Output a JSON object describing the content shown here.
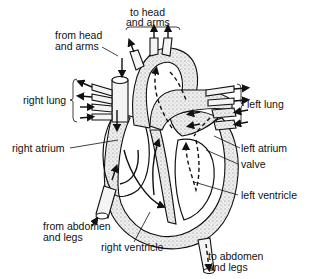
{
  "diagram": {
    "labels": {
      "to_head_and_arms": [
        "to head",
        "and arms"
      ],
      "from_head_and_arms": [
        "from head",
        "and arms"
      ],
      "right_lung": "right lung",
      "left_lung": "left lung",
      "right_atrium": "right atrium",
      "left_atrium": "left atrium",
      "valve": "valve",
      "left_ventricle": "left ventricle",
      "right_ventricle": "right ventricle",
      "from_abdomen_and_legs": [
        "from abdomen",
        "and legs"
      ],
      "to_abdomen_and_legs": [
        "to abdomen",
        "and legs"
      ]
    },
    "legend": {
      "solid_arrow": "deoxygenated blood flow (right side)",
      "dashed_arrow": "oxygenated blood flow (left side)"
    },
    "colors": {
      "ink": "#111111",
      "background": "#ffffff",
      "stipple": "#cfcfcf"
    }
  }
}
